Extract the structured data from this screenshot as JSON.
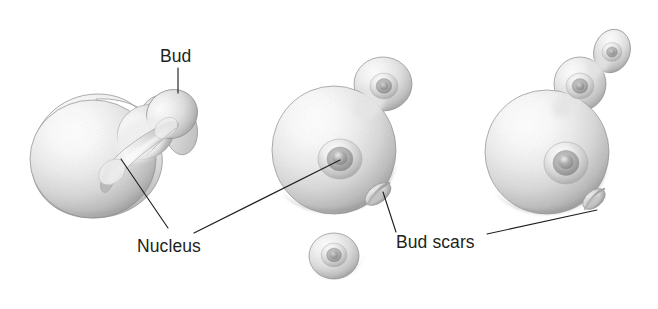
{
  "figure": {
    "background_color": "#ffffff",
    "ink_color": "#231f20",
    "width": 658,
    "height": 309
  },
  "labels": [
    {
      "id": "bud",
      "text": "Bud",
      "x": 160,
      "y": 62,
      "anchor": "start"
    },
    {
      "id": "nucleus",
      "text": "Nucleus",
      "x": 137,
      "y": 252,
      "anchor": "start"
    },
    {
      "id": "bud-scars",
      "text": "Bud scars",
      "x": 396,
      "y": 248,
      "anchor": "start"
    }
  ],
  "leader_lines": [
    {
      "id": "bud-leader",
      "from": [
        178,
        68
      ],
      "to": [
        178,
        93
      ]
    },
    {
      "id": "nucleus-leader-left",
      "from": [
        168,
        228
      ],
      "to": [
        121,
        159
      ]
    },
    {
      "id": "nucleus-leader-middle",
      "from": [
        194,
        233
      ],
      "to": [
        340,
        160
      ]
    },
    {
      "id": "bud-scars-leader-middle",
      "from": [
        396,
        232
      ],
      "to": [
        383,
        192
      ]
    },
    {
      "id": "bud-scars-leader-right",
      "from": [
        487,
        234
      ],
      "to": [
        597,
        210
      ]
    }
  ],
  "cells": [
    {
      "id": "cell-left-budding",
      "name": "budding yeast cell with elongating nucleus",
      "nuclei": 1,
      "buds": 1,
      "bud_scars": 0
    },
    {
      "id": "cell-middle",
      "name": "yeast cell with single bud and bud scar",
      "nuclei": 2,
      "buds": 1,
      "bud_scars": 1
    },
    {
      "id": "cell-small-daughter",
      "name": "small detached daughter cell",
      "nuclei": 1,
      "buds": 0,
      "bud_scars": 0
    },
    {
      "id": "cell-right",
      "name": "yeast cell with chain of two buds and bud scar",
      "nuclei": 3,
      "buds": 2,
      "bud_scars": 1
    }
  ],
  "palette": {
    "cell_light": "#fdfdfd",
    "cell_mid": "#d6d6d6",
    "cell_shadow": "#9b9b9b",
    "cell_edge": "#7a7a7a",
    "nucleus_core": "#9a9a9a",
    "scar_shadow": "#8f8f8f"
  }
}
